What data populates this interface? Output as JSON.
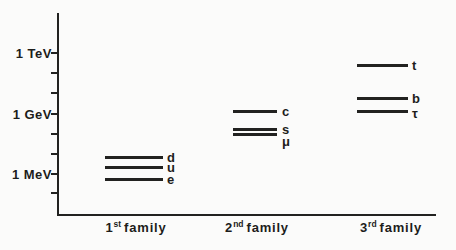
{
  "figure": {
    "background": "#fbfbfa",
    "ink": "#222220",
    "width": 456,
    "height": 250
  },
  "chart_data": {
    "type": "scatter",
    "title": "",
    "subtitle": "",
    "y_axis": {
      "scale": "log",
      "tick_labels": [
        "1 TeV",
        "1 GeV",
        "1 MeV"
      ],
      "minor_ticks": "one per decade between labeled decades",
      "range_MeV": [
        0.1,
        1000000
      ]
    },
    "x_categories": [
      "1st family",
      "2nd family",
      "3rd family"
    ],
    "families": [
      {
        "name": "1st family",
        "label_base": "1",
        "label_sup": "st",
        "label_word": "family",
        "column": {
          "line_x1": 105,
          "line_x2": 163,
          "label_x": 167,
          "family_cx": 136,
          "family_y": 220
        },
        "particles": [
          {
            "name": "d",
            "approx_mass_MeV": 7,
            "y": 156
          },
          {
            "name": "u",
            "approx_mass_MeV": 3,
            "y": 166
          },
          {
            "name": "e",
            "approx_mass_MeV": 0.5,
            "y": 178
          }
        ]
      },
      {
        "name": "2nd family",
        "label_base": "2",
        "label_sup": "nd",
        "label_word": "family",
        "column": {
          "line_x1": 233,
          "line_x2": 277,
          "label_x": 282,
          "family_cx": 257,
          "family_y": 220
        },
        "particles": [
          {
            "name": "c",
            "approx_mass_MeV": 1600,
            "y": 110
          },
          {
            "name": "s",
            "approx_mass_MeV": 180,
            "y": 128
          },
          {
            "name": "μ",
            "approx_mass_MeV": 106,
            "y": 133,
            "label_dy": 7
          }
        ]
      },
      {
        "name": "3rd family",
        "label_base": "3",
        "label_sup": "rd",
        "label_word": "family",
        "column": {
          "line_x1": 357,
          "line_x2": 408,
          "label_x": 412,
          "family_cx": 391,
          "family_y": 220
        },
        "particles": [
          {
            "name": "t",
            "approx_mass_MeV": 350000,
            "y": 64
          },
          {
            "name": "b",
            "approx_mass_MeV": 5500,
            "y": 97
          },
          {
            "name": "τ",
            "approx_mass_MeV": 1800,
            "y": 110,
            "label_dy": 2
          }
        ]
      }
    ],
    "layout": {
      "y_axis_x": 57,
      "y_axis_top": 13,
      "x_axis_y": 214,
      "x_axis_right": 436,
      "tick_len": 6,
      "tick_label_right": 52,
      "ticks": [
        {
          "y": 53,
          "label": "1 TeV"
        },
        {
          "y": 73
        },
        {
          "y": 93
        },
        {
          "y": 114,
          "label": "1 GeV"
        },
        {
          "y": 134
        },
        {
          "y": 154
        },
        {
          "y": 174,
          "label": "1 MeV"
        },
        {
          "y": 193
        }
      ]
    }
  }
}
